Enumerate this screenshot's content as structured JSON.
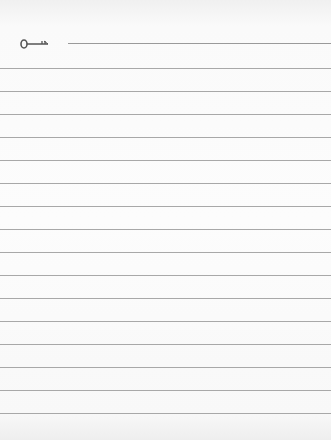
{
  "page": {
    "type": "lined-notepaper",
    "header": {
      "icon": "key-icon",
      "title_line": true
    },
    "rules": {
      "count": 16,
      "first_y": 68,
      "spacing": 23,
      "color": "#a8a8a8"
    },
    "colors": {
      "paper": "#fcfcfc",
      "icon": "#555555"
    }
  }
}
